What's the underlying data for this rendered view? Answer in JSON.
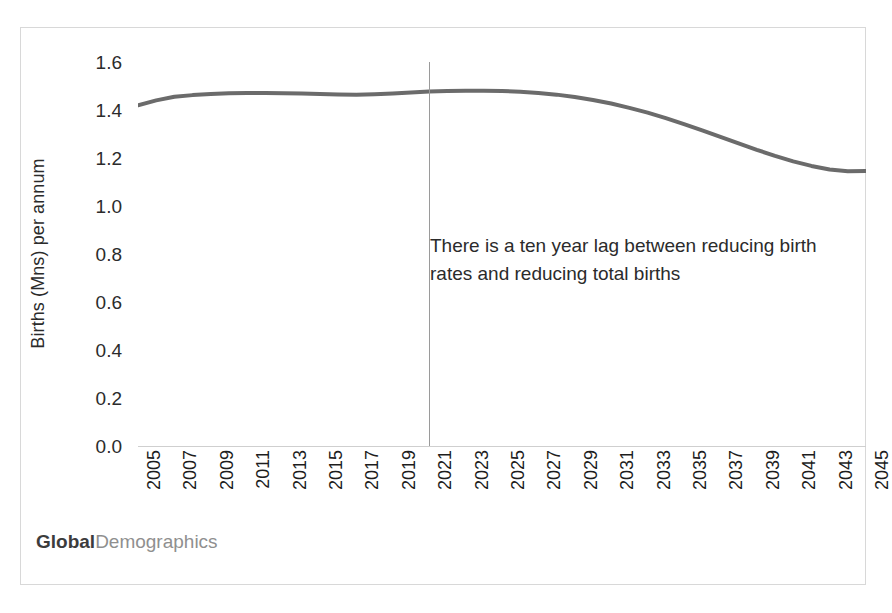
{
  "chart_data": {
    "type": "line",
    "title": "",
    "subtitle": "",
    "xlabel": "",
    "ylabel": "Births (Mns) per annum",
    "xlim": [
      2005,
      2045
    ],
    "ylim": [
      0.0,
      1.6
    ],
    "grid": false,
    "legend": "none",
    "line_color": "#6b6b6b",
    "x": [
      2005,
      2006,
      2007,
      2008,
      2009,
      2010,
      2011,
      2012,
      2013,
      2014,
      2015,
      2016,
      2017,
      2018,
      2019,
      2020,
      2021,
      2022,
      2023,
      2024,
      2025,
      2026,
      2027,
      2028,
      2029,
      2030,
      2031,
      2032,
      2033,
      2034,
      2035,
      2036,
      2037,
      2038,
      2039,
      2040,
      2041,
      2042,
      2043,
      2044,
      2045
    ],
    "values": [
      1.42,
      1.44,
      1.455,
      1.462,
      1.467,
      1.47,
      1.471,
      1.471,
      1.47,
      1.469,
      1.467,
      1.465,
      1.464,
      1.466,
      1.469,
      1.473,
      1.477,
      1.479,
      1.48,
      1.48,
      1.479,
      1.476,
      1.471,
      1.464,
      1.454,
      1.442,
      1.427,
      1.409,
      1.389,
      1.366,
      1.341,
      1.315,
      1.288,
      1.261,
      1.234,
      1.209,
      1.186,
      1.167,
      1.152,
      1.145,
      1.146
    ],
    "xtick_labels": [
      "2005",
      "2007",
      "2009",
      "2011",
      "2013",
      "2015",
      "2017",
      "2019",
      "2021",
      "2023",
      "2025",
      "2027",
      "2029",
      "2031",
      "2033",
      "2035",
      "2037",
      "2039",
      "2041",
      "2043",
      "2045"
    ],
    "xtick_values": [
      2005,
      2007,
      2009,
      2011,
      2013,
      2015,
      2017,
      2019,
      2021,
      2023,
      2025,
      2027,
      2029,
      2031,
      2033,
      2035,
      2037,
      2039,
      2041,
      2043,
      2045
    ],
    "ytick_labels": [
      "1.6",
      "1.4",
      "1.2",
      "1.0",
      "0.8",
      "0.6",
      "0.4",
      "0.2",
      "0.0"
    ],
    "ytick_values": [
      1.6,
      1.4,
      1.2,
      1.0,
      0.8,
      0.6,
      0.4,
      0.2,
      0.0
    ],
    "marker_line": {
      "x": 2021,
      "label": "",
      "color": "#9a9a9a"
    },
    "annotations": [
      {
        "text": "There is a ten year lag between reducing birth rates and reducing total births",
        "x": 2022,
        "y": 0.82
      }
    ]
  },
  "branding": {
    "primary": "Global",
    "secondary": "Demographics"
  }
}
